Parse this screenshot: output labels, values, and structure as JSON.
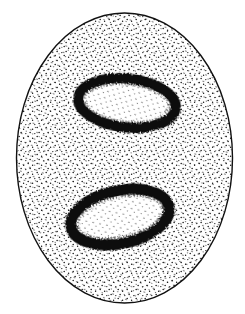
{
  "figure": {
    "description": "Stippled ink illustration of an oval cell containing two ring-shaped dark bodies",
    "background": "#ffffff",
    "ink": "#111111",
    "cell": {
      "cx": 124.5,
      "cy": 158,
      "rx": 108,
      "ry": 145,
      "stroke_width": 1.4
    },
    "bodies": [
      {
        "name": "upper-body",
        "cx": 127,
        "cy": 103,
        "rx": 54,
        "ry": 29,
        "rotate": 6
      },
      {
        "name": "lower-body",
        "cx": 120,
        "cy": 217,
        "rx": 56,
        "ry": 32,
        "rotate": -12
      }
    ]
  }
}
